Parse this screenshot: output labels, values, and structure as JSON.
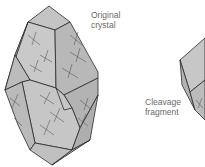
{
  "caption_top": "",
  "labels": {
    "original_crystal": "Original\ncrystal",
    "cleavage_fragment": "Cleavage\nfragment"
  },
  "colors": {
    "face_light": "#c9c9c9",
    "face_mid": "#bdbdbd",
    "face_dark": "#aaaaaa",
    "edge": "#2a2a2a",
    "cleavage_line": "#5a5a5a",
    "label_text": "#6b6b6b"
  }
}
